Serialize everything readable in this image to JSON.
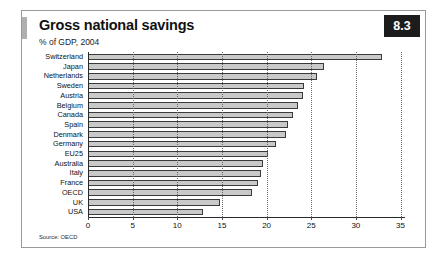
{
  "card": {
    "title": "Gross national savings",
    "subtitle": "% of GDP, 2004",
    "badge": "8.3",
    "source": "Source: OECD"
  },
  "chart_data": {
    "type": "bar",
    "orientation": "horizontal",
    "title": "Gross national savings",
    "subtitle": "% of GDP, 2004",
    "xlabel": "",
    "ylabel": "",
    "xlim": [
      0,
      35.5
    ],
    "xticks": [
      0,
      5,
      10,
      15,
      20,
      25,
      30,
      35
    ],
    "xtick_labels": [
      "0",
      "5",
      "10",
      "15",
      "20",
      "25",
      "30",
      "35"
    ],
    "grid": "vertical-dotted",
    "legend": "none",
    "bar_fill": "#c9c9c9",
    "bar_stroke": "#3a3a3a",
    "categories": [
      "Switzerland",
      "Japan",
      "Netherlands",
      "Sweden",
      "Austria",
      "Belgium",
      "Canada",
      "Spain",
      "Denmark",
      "Germany",
      "EU25",
      "Australia",
      "Italy",
      "France",
      "OECD",
      "UK",
      "USA"
    ],
    "values": [
      32.9,
      26.4,
      25.7,
      24.2,
      24.1,
      23.5,
      23.0,
      22.4,
      22.2,
      21.0,
      20.2,
      19.6,
      19.4,
      19.0,
      18.4,
      14.8,
      12.9
    ],
    "source": "Source: OECD"
  }
}
